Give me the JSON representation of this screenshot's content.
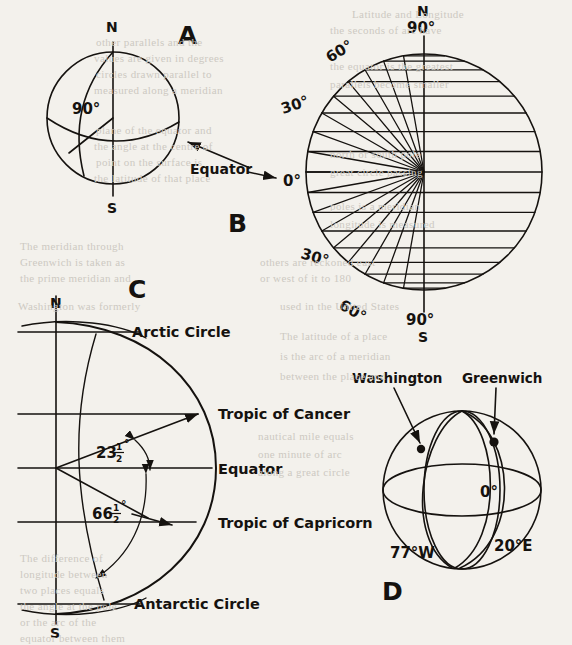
{
  "figure": {
    "background_color": "#f3f1ec",
    "ink_color": "#15120f",
    "bleed_color": "#cdc9c2",
    "panels": [
      {
        "letter": "A",
        "name": "panel-a-sphere-latitude-90",
        "caption_x": 178,
        "caption_y": 44,
        "description": "Sphere with polar axis, equator and meridian; 90 degree central angle marked",
        "sphere": {
          "cx": 113,
          "cy": 118,
          "r": 66
        },
        "labels": {
          "north_pole": "N",
          "south_pole": "S",
          "angle": "90°",
          "equator": "Equator",
          "equator_value": "0°"
        }
      },
      {
        "letter": "B",
        "name": "panel-b-latitude-parallels",
        "caption_x": 228,
        "caption_y": 232,
        "description": "Circle with radii from the centre to the left limb at 10 degree intervals and horizontal parallels of latitude",
        "sphere": {
          "cx": 424,
          "cy": 172,
          "r": 118
        },
        "labels": {
          "north_pole": "N",
          "north_pole_value": "90°",
          "north_60": "60°",
          "north_30": "30°",
          "equator_value": "0°",
          "south_30": "30°",
          "south_60": "60°",
          "south_pole_value": "90°",
          "south_pole": "S"
        }
      },
      {
        "letter": "C",
        "name": "panel-c-special-latitude-circles",
        "caption_x": 128,
        "caption_y": 289,
        "description": "Half globe cross-section naming the Arctic Circle, Tropic of Cancer, Equator, Tropic of Capricorn and Antarctic Circle with the 23 1/2 degree and 66 1/2 degree angles",
        "axis_x": 56,
        "center": {
          "cx": 56,
          "cy": 468
        },
        "labels": {
          "north_pole": "N",
          "south_pole": "S",
          "arctic_circle": "Arctic Circle",
          "tropic_of_cancer": "Tropic of Cancer",
          "equator": "Equator",
          "tropic_of_capricorn": "Tropic of Capricorn",
          "antarctic_circle": "Antarctic Circle",
          "angle_cancer_whole": "23",
          "angle_cancer_num": "1",
          "angle_cancer_den": "2",
          "angle_cancer_deg": "°",
          "angle_polar_whole": "66",
          "angle_polar_num": "1",
          "angle_polar_den": "2",
          "angle_polar_deg": "°"
        }
      },
      {
        "letter": "D",
        "name": "panel-d-longitude-meridians",
        "caption_x": 382,
        "caption_y": 592,
        "description": "Globe showing the Washington and Greenwich meridians with longitudes 77 degrees West, 0 degrees and 20 degrees East",
        "sphere": {
          "cx": 462,
          "cy": 490,
          "r": 79
        },
        "labels": {
          "washington": "Washington",
          "greenwich": "Greenwich",
          "longitude_west": "77°W",
          "longitude_prime": "0°",
          "longitude_east": "20°E"
        }
      }
    ],
    "bleed_text": [
      {
        "text": "Latitude and Longitude",
        "x": 352,
        "y": 8
      },
      {
        "text": "the seconds of arc have",
        "x": 330,
        "y": 24
      },
      {
        "text": "other parallels and the",
        "x": 96,
        "y": 36
      },
      {
        "text": "values are given in degrees",
        "x": 94,
        "y": 52
      },
      {
        "text": "circles drawn parallel to",
        "x": 96,
        "y": 68
      },
      {
        "text": "measured along a meridian",
        "x": 94,
        "y": 84
      },
      {
        "text": "the equator is the greatest",
        "x": 330,
        "y": 60
      },
      {
        "text": "parallels become smaller",
        "x": 330,
        "y": 78
      },
      {
        "text": "plane of the equator and",
        "x": 96,
        "y": 124
      },
      {
        "text": "the angle at the centre of",
        "x": 94,
        "y": 140
      },
      {
        "text": "point on the surface is",
        "x": 96,
        "y": 156
      },
      {
        "text": "the latitude of that place",
        "x": 94,
        "y": 172
      },
      {
        "text": "north or south pole",
        "x": 330,
        "y": 148
      },
      {
        "text": "great circle passing",
        "x": 330,
        "y": 166
      },
      {
        "text": "poles is a meridian",
        "x": 330,
        "y": 200
      },
      {
        "text": "longitude is measured",
        "x": 330,
        "y": 218
      },
      {
        "text": "The meridian through",
        "x": 20,
        "y": 240
      },
      {
        "text": "Greenwich is taken as",
        "x": 20,
        "y": 256
      },
      {
        "text": "the prime meridian and",
        "x": 20,
        "y": 272
      },
      {
        "text": "others are reckoned east",
        "x": 260,
        "y": 256
      },
      {
        "text": "or west of it to 180",
        "x": 260,
        "y": 272
      },
      {
        "text": "Washington was formerly",
        "x": 18,
        "y": 300
      },
      {
        "text": "used in the United States",
        "x": 280,
        "y": 300
      },
      {
        "text": "The latitude of a place",
        "x": 280,
        "y": 330
      },
      {
        "text": "is the arc of a meridian",
        "x": 280,
        "y": 350
      },
      {
        "text": "between the place and",
        "x": 280,
        "y": 370
      },
      {
        "text": "nautical mile equals",
        "x": 258,
        "y": 430
      },
      {
        "text": "one minute of arc",
        "x": 258,
        "y": 448
      },
      {
        "text": "along a great circle",
        "x": 258,
        "y": 466
      },
      {
        "text": "The difference of",
        "x": 20,
        "y": 552
      },
      {
        "text": "longitude between",
        "x": 20,
        "y": 568
      },
      {
        "text": "two places equals",
        "x": 20,
        "y": 584
      },
      {
        "text": "the angle at the pole",
        "x": 20,
        "y": 600
      },
      {
        "text": "or the arc of the",
        "x": 20,
        "y": 616
      },
      {
        "text": "equator between them",
        "x": 20,
        "y": 632
      }
    ]
  }
}
